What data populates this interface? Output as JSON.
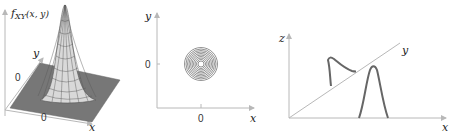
{
  "panels": [
    {
      "id": "surface",
      "type": "3d-surface",
      "z_label": "f",
      "z_label_sub": "XY",
      "z_label_args": "(x, y)",
      "x_label": "x",
      "y_label": "y",
      "x_origin_label": "0",
      "y_origin_label": "0",
      "description": "Bivariate Gaussian joint PDF surface"
    },
    {
      "id": "contour",
      "type": "contour",
      "x_label": "x",
      "y_label": "y",
      "x_tick_label": "0",
      "y_tick_label": "0",
      "description": "Concentric circular contour lines centered at origin"
    },
    {
      "id": "marginals",
      "type": "3d-line",
      "x_label": "x",
      "y_label": "y",
      "z_label": "z",
      "description": "Two bell-shaped curves: one in the y-z plane, one in the x-z plane"
    }
  ],
  "colors": {
    "axis": "#b8b8b8",
    "surface": "#6e6e6e",
    "curve": "#666666",
    "text": "#222222"
  }
}
